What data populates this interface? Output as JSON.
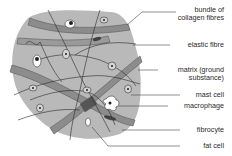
{
  "figure": {
    "colors": {
      "matrix": "#b9b9b9",
      "collagen": "#8c8c8c",
      "collagen_edge": "#5a5a5a",
      "fibre": "#2a2a2a",
      "leader": "#444444",
      "cell_fill": "#d4d4d4",
      "nucleus": "#222222"
    },
    "labels": [
      {
        "id": "collagen",
        "text_lines": [
          "bundle of",
          "collagen fibres"
        ]
      },
      {
        "id": "elastic",
        "text_lines": [
          "elastic fibre"
        ]
      },
      {
        "id": "matrix",
        "text_lines": [
          "matrix (ground",
          "substance)"
        ]
      },
      {
        "id": "mast",
        "text_lines": [
          "mast cell"
        ]
      },
      {
        "id": "macrophage",
        "text_lines": [
          "macrophage"
        ]
      },
      {
        "id": "fibrocyte",
        "text_lines": [
          "fibrocyte"
        ]
      },
      {
        "id": "fat",
        "text_lines": [
          "fat cell"
        ]
      }
    ]
  }
}
